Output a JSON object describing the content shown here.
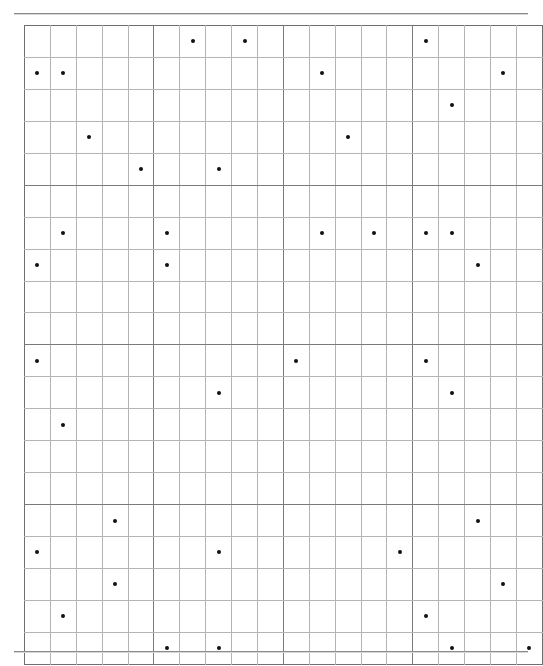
{
  "page": {
    "width": 543,
    "height": 666,
    "background": "#ffffff"
  },
  "rules": {
    "top": {
      "label": "top-horizontal-rule",
      "color": "#8a8a8a"
    },
    "bottom": {
      "label": "bottom-horizontal-rule",
      "color": "#8a8a8a"
    }
  },
  "grid": {
    "rows": 20,
    "cols": 20,
    "cell_width": 24.9,
    "cell_height": 30.95,
    "line_color": "#b4b4b4",
    "block_line_color": "#7a7a7a",
    "border_color": "#6e6e6e",
    "block_every": 5,
    "dot_color": "#111111",
    "dot_radius": 2
  },
  "chart_data": {
    "type": "scatter",
    "title": "",
    "subtitle": "",
    "xlabel": "",
    "ylabel": "",
    "xlim": [
      0,
      20
    ],
    "ylim": [
      0,
      20
    ],
    "grid": true,
    "legend": null,
    "annotations": [],
    "tick_labels": {
      "x": [],
      "y": []
    },
    "marker": "filled-circle",
    "dot_count": 37,
    "points": [
      {
        "row": 1,
        "col": 7
      },
      {
        "row": 1,
        "col": 9
      },
      {
        "row": 1,
        "col": 16
      },
      {
        "row": 2,
        "col": 1
      },
      {
        "row": 2,
        "col": 2
      },
      {
        "row": 2,
        "col": 12
      },
      {
        "row": 2,
        "col": 19
      },
      {
        "row": 3,
        "col": 17
      },
      {
        "row": 4,
        "col": 3
      },
      {
        "row": 4,
        "col": 13
      },
      {
        "row": 5,
        "col": 5
      },
      {
        "row": 5,
        "col": 8
      },
      {
        "row": 7,
        "col": 2
      },
      {
        "row": 7,
        "col": 6
      },
      {
        "row": 7,
        "col": 12
      },
      {
        "row": 7,
        "col": 14
      },
      {
        "row": 7,
        "col": 16
      },
      {
        "row": 7,
        "col": 17
      },
      {
        "row": 8,
        "col": 1
      },
      {
        "row": 8,
        "col": 6
      },
      {
        "row": 8,
        "col": 18
      },
      {
        "row": 11,
        "col": 1
      },
      {
        "row": 11,
        "col": 11
      },
      {
        "row": 11,
        "col": 16
      },
      {
        "row": 12,
        "col": 8
      },
      {
        "row": 12,
        "col": 17
      },
      {
        "row": 13,
        "col": 2
      },
      {
        "row": 16,
        "col": 4
      },
      {
        "row": 16,
        "col": 18
      },
      {
        "row": 17,
        "col": 1
      },
      {
        "row": 17,
        "col": 8
      },
      {
        "row": 17,
        "col": 15
      },
      {
        "row": 18,
        "col": 4
      },
      {
        "row": 18,
        "col": 19
      },
      {
        "row": 19,
        "col": 2
      },
      {
        "row": 19,
        "col": 16
      },
      {
        "row": 20,
        "col": 6
      },
      {
        "row": 20,
        "col": 8
      },
      {
        "row": 20,
        "col": 17
      },
      {
        "row": 20,
        "col": 20
      }
    ]
  }
}
